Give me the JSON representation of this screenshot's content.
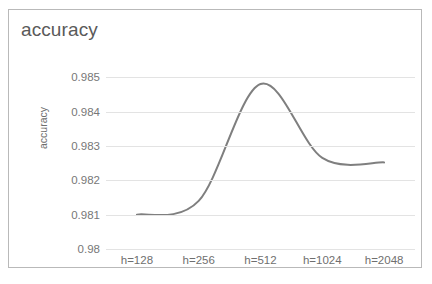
{
  "chart_data": {
    "type": "line",
    "title": "accuracy",
    "xlabel": "",
    "ylabel": "accuracy",
    "categories": [
      "h=128",
      "h=256",
      "h=512",
      "h=1024",
      "h=2048"
    ],
    "series": [
      {
        "name": "accuracy",
        "color": "#7f7f7f",
        "values": [
          0.981,
          0.9814,
          0.9848,
          0.98265,
          0.98252
        ]
      }
    ],
    "y_ticks": [
      "0.985",
      "0.984",
      "0.983",
      "0.982",
      "0.981",
      "0.98"
    ],
    "y_tick_values": [
      0.985,
      0.984,
      0.983,
      0.982,
      0.981,
      0.98
    ],
    "ylim": [
      0.98,
      0.9855
    ],
    "grid": true,
    "legend": "none",
    "smoothing": "spline",
    "annotations": {
      "peak_label": "peak near h=512",
      "peak_value": 0.9848
    }
  },
  "colors": {
    "line": "#7f7f7f",
    "gridline": "#e3e3e3",
    "border": "#b9b9b9",
    "title_text": "#5a5a5a",
    "tick_text": "#777777",
    "background": "#ffffff"
  }
}
